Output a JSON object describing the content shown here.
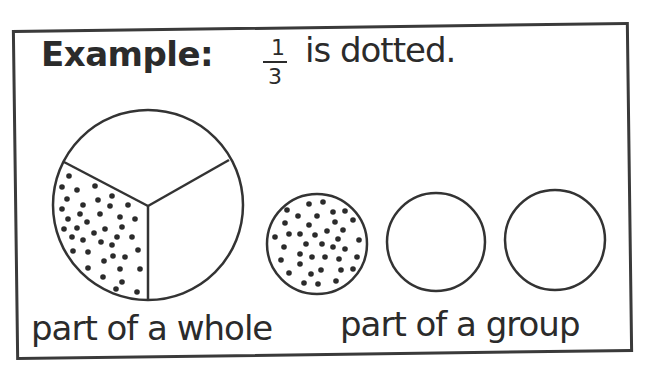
{
  "example": {
    "label": "Example:",
    "fraction": {
      "numerator": "1",
      "denominator": "3"
    },
    "statement": "is dotted."
  },
  "captions": {
    "whole": "part of a whole",
    "group": "part of a group"
  },
  "figures": {
    "whole_circle": {
      "cx": 148,
      "cy": 205,
      "r": 95,
      "parts": 3,
      "dotted_parts": 1
    },
    "group_circles": [
      {
        "cx": 317,
        "cy": 244,
        "r": 50,
        "dotted": true
      },
      {
        "cx": 436,
        "cy": 242,
        "r": 49,
        "dotted": false
      },
      {
        "cx": 555,
        "cy": 240,
        "r": 50,
        "dotted": false
      }
    ]
  },
  "colors": {
    "ink": "#2b2b2b",
    "background": "#ffffff"
  }
}
